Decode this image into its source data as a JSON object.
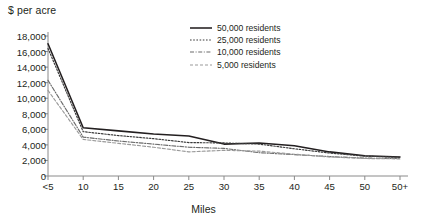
{
  "chart_data": {
    "type": "line",
    "title": "",
    "ylabel": "$ per acre",
    "xlabel": "Miles",
    "categories": [
      "<5",
      "10",
      "15",
      "20",
      "25",
      "30",
      "35",
      "40",
      "45",
      "50",
      "50+"
    ],
    "ylim": [
      0,
      18000
    ],
    "yticks": [
      "0",
      "2,000",
      "4,000",
      "6,000",
      "8,000",
      "10,000",
      "12,000",
      "14,000",
      "16,000",
      "18,000"
    ],
    "ytick_values": [
      0,
      2000,
      4000,
      6000,
      8000,
      10000,
      12000,
      14000,
      16000,
      18000
    ],
    "grid": false,
    "legend_position": "top-right-inside",
    "series": [
      {
        "name": "50,000 residents",
        "style": "solid",
        "color": "#231f20",
        "values": [
          17000,
          6200,
          5800,
          5400,
          5150,
          4100,
          4250,
          3900,
          3100,
          2600,
          2450
        ]
      },
      {
        "name": "25,000 residents",
        "style": "dotted",
        "color": "#3a3a3a",
        "values": [
          16400,
          5700,
          5200,
          4800,
          4300,
          4250,
          4100,
          3500,
          2950,
          2550,
          2400
        ]
      },
      {
        "name": "10,000 residents",
        "style": "dash-dot",
        "color": "#6b6b6b",
        "values": [
          12300,
          5000,
          4500,
          4100,
          3700,
          3550,
          3000,
          2750,
          2500,
          2300,
          2250
        ]
      },
      {
        "name": "5,000 residents",
        "style": "dashed",
        "color": "#9a9a9a",
        "values": [
          11000,
          4700,
          4200,
          3700,
          3100,
          3300,
          3200,
          2800,
          2450,
          2250,
          2200
        ]
      }
    ]
  }
}
